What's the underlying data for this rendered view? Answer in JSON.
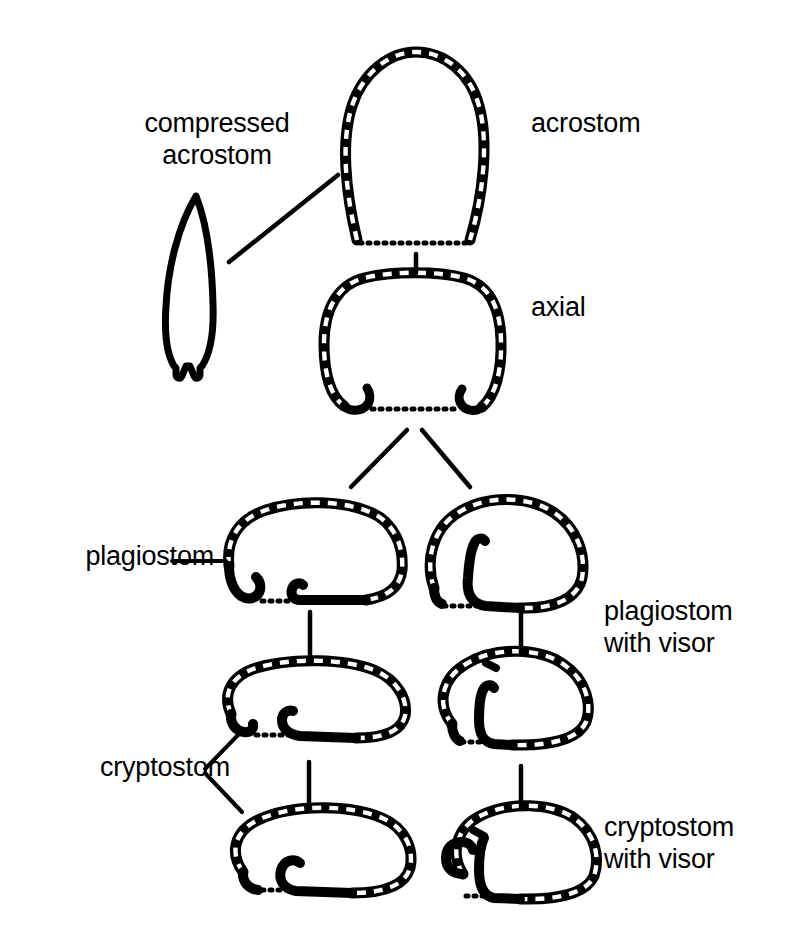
{
  "figure": {
    "background_color": "#ffffff",
    "ink_color": "#000000",
    "width": 801,
    "height": 945
  },
  "labels": {
    "compressed_acrostom": "compressed\nacrostom",
    "acrostom": "acrostom",
    "axial": "axial",
    "plagiostom": "plagiostom",
    "plagiostom_with_visor": "plagiostom\nwith visor",
    "cryptostom": "cryptostom",
    "cryptostom_with_visor": "cryptostom\nwith visor"
  },
  "shapes": [
    {
      "id": "compressed-acrostom",
      "label": "compressed acrostom",
      "style": "solid-outline",
      "description": "narrow lens shape, pointed apex, small notch at base"
    },
    {
      "id": "acrostom",
      "label": "acrostom",
      "style": "beaded-outline",
      "description": "tall rounded-arch aperture, open base with dotted line"
    },
    {
      "id": "axial",
      "label": "axial",
      "style": "beaded-outline",
      "description": "broad rounded aperture with two inward hooks at base"
    },
    {
      "id": "plagiostom",
      "label": "plagiostom",
      "style": "beaded-outline",
      "description": "oblique aperture, hooks at base, left hook inturned"
    },
    {
      "id": "plagiostom-with-visor",
      "label": "plagiostom with visor",
      "style": "beaded-outline",
      "description": "oblique aperture with inner coiled visor flap"
    },
    {
      "id": "cryptostom",
      "label": "cryptostom",
      "style": "beaded-outline",
      "description": "low elongate aperture, concealed opening at base"
    },
    {
      "id": "cryptostom-with-visor",
      "label": "cryptostom with visor",
      "style": "beaded-outline",
      "description": "low aperture with inner visor partition on left"
    },
    {
      "id": "cryptostom-lower-left",
      "label": "cryptostom",
      "style": "beaded-outline",
      "description": "lowest-left aperture, hooded opening"
    },
    {
      "id": "cryptostom-visor-lower-right",
      "label": "cryptostom with visor",
      "style": "beaded-outline",
      "description": "lowest-right aperture with visor wall"
    }
  ],
  "connectors": [
    {
      "id": "leader-compressed-acrostom",
      "kind": "leader-line",
      "from": "compressed-acrostom",
      "to": "acrostom"
    },
    {
      "id": "link-acrostom-axial",
      "kind": "vertical-tick",
      "from": "acrostom",
      "to": "axial"
    },
    {
      "id": "branch-axial-left",
      "kind": "diagonal",
      "from": "axial",
      "to": "plagiostom"
    },
    {
      "id": "branch-axial-right",
      "kind": "diagonal",
      "from": "axial",
      "to": "plagiostom-with-visor"
    },
    {
      "id": "link-plagiostom-middleleft",
      "kind": "vertical-tick",
      "from": "plagiostom",
      "to": "cryptostom"
    },
    {
      "id": "link-plagiostomvisor-middleright",
      "kind": "vertical-tick",
      "from": "plagiostom-with-visor",
      "to": "cryptostom-with-visor"
    },
    {
      "id": "link-middleleft-bottomleft",
      "kind": "vertical-tick",
      "from": "cryptostom",
      "to": "cryptostom-lower-left"
    },
    {
      "id": "link-middleright-bottomright",
      "kind": "vertical-tick",
      "from": "cryptostom-with-visor",
      "to": "cryptostom-visor-lower-right"
    },
    {
      "id": "leader-plagiostom-label",
      "kind": "leader-line",
      "from": "plagiostom-label",
      "to": "plagiostom"
    },
    {
      "id": "bracket-cryptostom-label",
      "kind": "bracket",
      "from": "cryptostom-label",
      "to": "cryptostom,cryptostom-lower-left"
    }
  ]
}
